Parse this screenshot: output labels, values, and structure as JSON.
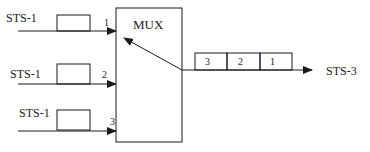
{
  "diagram": {
    "mux": {
      "label": "MUX"
    },
    "inputs": [
      {
        "label": "STS-1",
        "port": "1"
      },
      {
        "label": "STS-1",
        "port": "2"
      },
      {
        "label": "STS-1",
        "port": "3"
      }
    ],
    "output": {
      "label": "STS-3",
      "frames": [
        "3",
        "2",
        "1"
      ]
    },
    "colors": {
      "stroke": "#1a1a1a",
      "background": "#ffffff"
    }
  }
}
